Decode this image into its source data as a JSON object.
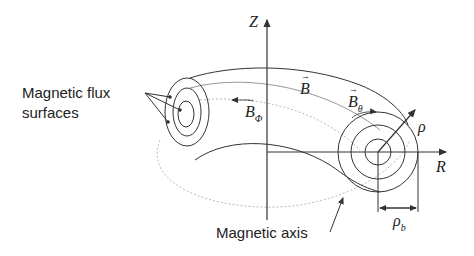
{
  "diagram": {
    "colors": {
      "line": "#333333",
      "dotted": "#aaaaaa",
      "text": "#222222"
    },
    "labels": {
      "flux_surfaces_line1": "Magnetic flux",
      "flux_surfaces_line2": "surfaces",
      "magnetic_axis": "Magnetic axis",
      "z_axis": "Z",
      "r_axis": "R",
      "b_field": "B",
      "b_phi": "B",
      "b_phi_sub": "Φ",
      "b_theta": "B",
      "b_theta_sub": "θ",
      "rho": "ρ",
      "rho_b": "ρ",
      "rho_b_sub": "b"
    }
  }
}
